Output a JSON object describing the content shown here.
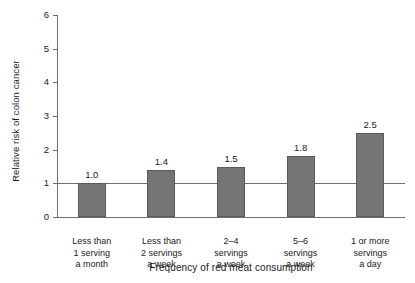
{
  "chart_data": {
    "type": "bar",
    "title": "",
    "xlabel": "Frequency of red meat consumption",
    "ylabel": "Relative risk of colon cancer",
    "categories": [
      "Less than 1 serving a month",
      "Less than 2 servings a week",
      "2–4 servings a week",
      "5–6 servings a week",
      "1 or more servings a day"
    ],
    "category_lines": [
      [
        "Less than",
        "1 serving",
        "a month"
      ],
      [
        "Less than",
        "2 servings",
        "a week"
      ],
      [
        "2–4",
        "servings",
        "a week"
      ],
      [
        "5–6",
        "servings",
        "a week"
      ],
      [
        "1 or more",
        "servings",
        "a day"
      ]
    ],
    "values": [
      1.0,
      1.4,
      1.5,
      1.8,
      2.5
    ],
    "value_labels": [
      "1.0",
      "1.4",
      "1.5",
      "1.8",
      "2.5"
    ],
    "ylim": [
      0,
      6
    ],
    "yticks": [
      0,
      1,
      2,
      3,
      4,
      5,
      6
    ],
    "ytick_labels": [
      "0",
      "1",
      "2",
      "3",
      "4",
      "5",
      "6"
    ],
    "grid": false,
    "legend": false,
    "reference_line": 1.0,
    "bar_color": "#757575",
    "bar_edge_color": "#5a5a5a",
    "axis_color": "#6e6e6e",
    "background_color": "#ffffff"
  }
}
